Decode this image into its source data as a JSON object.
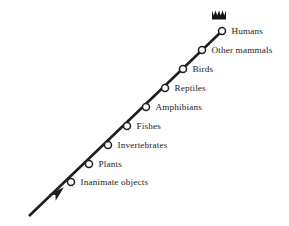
{
  "figure": {
    "kind": "chain-of-being-ladder",
    "background_color": "#ffffff",
    "ink_color": "#1f1f1f",
    "text_color": "#1a1a1a",
    "direction_description": "ascending arrow from lower-left to upper-right"
  },
  "crown": {
    "icon": "crown-icon",
    "center_x": 219,
    "center_y": 15,
    "width": 14,
    "height": 9,
    "points": 5
  },
  "arrow": {
    "icon": "arrow-up-right-icon",
    "tail_x": 29,
    "tail_y": 216,
    "head_x": 57,
    "head_y": 193
  },
  "axis": {
    "start_x": 29,
    "start_y": 216,
    "end_x": 222,
    "end_y": 31
  },
  "nodes": [
    {
      "label": "Humans",
      "x": 222,
      "y": 31,
      "rank": 9
    },
    {
      "label": "Other mammals",
      "x": 202,
      "y": 50,
      "rank": 8
    },
    {
      "label": "Birds",
      "x": 183,
      "y": 69,
      "rank": 7
    },
    {
      "label": "Reptiles",
      "x": 165,
      "y": 88,
      "rank": 6
    },
    {
      "label": "Amphibians",
      "x": 146,
      "y": 107,
      "rank": 5
    },
    {
      "label": "Fishes",
      "x": 127,
      "y": 126,
      "rank": 4
    },
    {
      "label": "Invertebrates",
      "x": 108,
      "y": 145,
      "rank": 3
    },
    {
      "label": "Plants",
      "x": 89,
      "y": 164,
      "rank": 2
    },
    {
      "label": "Inanimate objects",
      "x": 71,
      "y": 182,
      "rank": 1
    }
  ],
  "node_style": {
    "radius": 3.5,
    "label_offset_x": 6,
    "label_offset_y": 1
  },
  "chart_data": {
    "type": "diagram",
    "title": "",
    "categories": [
      "Inanimate objects",
      "Plants",
      "Invertebrates",
      "Fishes",
      "Amphibians",
      "Reptiles",
      "Birds",
      "Other mammals",
      "Humans"
    ],
    "values": [
      1,
      2,
      3,
      4,
      5,
      6,
      7,
      8,
      9
    ],
    "xlabel": "",
    "ylabel": "",
    "legend": [],
    "annotations": [
      "crown above Humans",
      "arrowhead at base of chain"
    ]
  }
}
